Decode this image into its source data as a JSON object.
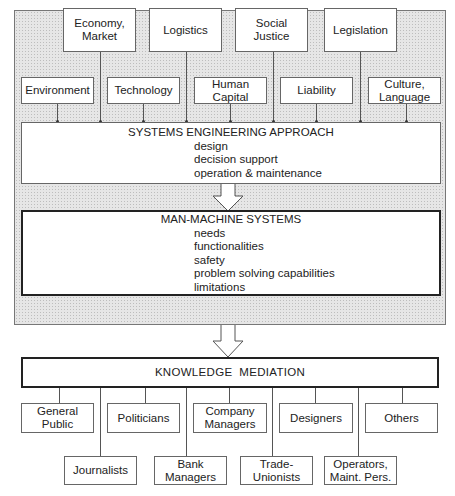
{
  "factors_top": [
    {
      "label": "Economy,\nMarket",
      "lines": [
        "Economy,",
        "Market"
      ]
    },
    {
      "label": "Logistics",
      "lines": [
        "Logistics"
      ]
    },
    {
      "label": "Social Justice",
      "lines": [
        "Social",
        "Justice"
      ]
    },
    {
      "label": "Legislation",
      "lines": [
        "Legislation"
      ]
    }
  ],
  "factors_bottom": [
    {
      "lines": [
        "Environment"
      ]
    },
    {
      "lines": [
        "Technology"
      ]
    },
    {
      "lines": [
        "Human",
        "Capital"
      ]
    },
    {
      "lines": [
        "Liability"
      ]
    },
    {
      "lines": [
        "Culture,",
        "Language"
      ]
    }
  ],
  "systems_engineering": {
    "title": "SYSTEMS ENGINEERING APPROACH",
    "items": [
      "design",
      "decision support",
      "operation & maintenance"
    ]
  },
  "man_machine": {
    "title": "MAN-MACHINE SYSTEMS",
    "items": [
      "needs",
      "functionalities",
      "safety",
      "problem solving capabilities",
      "limitations"
    ]
  },
  "knowledge_mediation": {
    "title": "KNOWLEDGE  MEDIATION"
  },
  "audiences_row1": [
    {
      "lines": [
        "General",
        "Public"
      ]
    },
    {
      "lines": [
        "Politicians"
      ]
    },
    {
      "lines": [
        "Company",
        "Managers"
      ]
    },
    {
      "lines": [
        "Designers"
      ]
    },
    {
      "lines": [
        "Others"
      ]
    }
  ],
  "audiences_row2": [
    {
      "lines": [
        "Journalists"
      ]
    },
    {
      "lines": [
        "Bank",
        "Managers"
      ]
    },
    {
      "lines": [
        "Trade-",
        "Unionists"
      ]
    },
    {
      "lines": [
        "Operators,",
        "Maint. Pers."
      ]
    }
  ]
}
